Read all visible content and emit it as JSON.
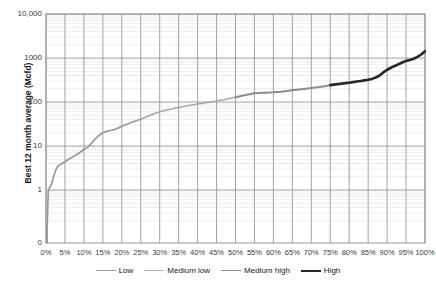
{
  "chart_data": {
    "type": "line",
    "title": "",
    "xlabel": "",
    "ylabel": "Best 12 month average (Mcfd)",
    "yscale": "log",
    "ylim": [
      0.1,
      10000
    ],
    "xlim": [
      0,
      100
    ],
    "grid": true,
    "legend_position": "bottom",
    "y_tick_labels": [
      "10,000",
      "1000",
      "100",
      "10",
      "1",
      "0"
    ],
    "y_tick_values": [
      10000,
      1000,
      100,
      10,
      1,
      0.1
    ],
    "x_tick_labels": [
      "0%",
      "5%",
      "10%",
      "15%",
      "20%",
      "25%",
      "30%",
      "35%",
      "40%",
      "45%",
      "50%",
      "55%",
      "60%",
      "65%",
      "70%",
      "75%",
      "80%",
      "85%",
      "90%",
      "95%",
      "100%"
    ],
    "x_tick_values": [
      0,
      5,
      10,
      15,
      20,
      25,
      30,
      35,
      40,
      45,
      50,
      55,
      60,
      65,
      70,
      75,
      80,
      85,
      90,
      95,
      100
    ],
    "series": [
      {
        "name": "Low",
        "color": "#9a9a9a",
        "x": [
          0.3,
          0.6,
          0.9,
          1.2,
          1.6,
          2.0,
          2.6,
          3.2,
          4.0,
          5.0,
          6.0,
          7.0,
          8.0,
          9.0,
          10.0,
          11.0,
          12.0,
          13.0,
          14.0,
          15.0,
          16.0,
          17.0,
          18.0,
          19.0,
          20.0,
          21.0,
          22.0,
          23.0,
          24.0,
          25.0
        ],
        "y": [
          0.14,
          0.9,
          1.15,
          1.2,
          1.5,
          2.0,
          2.9,
          3.5,
          3.9,
          4.4,
          5.0,
          5.6,
          6.3,
          7.2,
          8.3,
          9.4,
          11.5,
          14.5,
          17.5,
          20.0,
          21.5,
          22.5,
          23.5,
          25.5,
          28.0,
          30.5,
          33.0,
          35.5,
          38.0,
          40.5
        ]
      },
      {
        "name": "Medium low",
        "color": "#a6a6a6",
        "x": [
          25.0,
          26.0,
          27.0,
          28.0,
          29.0,
          30.0,
          31.0,
          32.0,
          33.0,
          34.0,
          35.0,
          36.0,
          37.0,
          38.0,
          39.0,
          40.0,
          41.0,
          42.0,
          43.0,
          44.0,
          45.0,
          46.0,
          47.0,
          48.0,
          49.0,
          50.0
        ],
        "y": [
          40.5,
          44.0,
          48.0,
          52.0,
          56.0,
          60.0,
          63.0,
          66.0,
          69.0,
          72.0,
          75.0,
          78.0,
          81.0,
          84.0,
          87.0,
          90.0,
          93.0,
          96.0,
          99.0,
          102.0,
          105.0,
          109.0,
          113.0,
          118.0,
          123.0,
          128.0
        ]
      },
      {
        "name": "Medium high",
        "color": "#8c8c8c",
        "x": [
          50.0,
          52.0,
          54.0,
          55.0,
          56.0,
          58.0,
          60.0,
          62.0,
          64.0,
          65.0,
          66.0,
          68.0,
          70.0,
          72.0,
          74.0,
          75.0
        ],
        "y": [
          128.0,
          140.0,
          152.0,
          158.0,
          160.0,
          163.0,
          166.0,
          172.0,
          180.0,
          185.0,
          190.0,
          198.0,
          207.0,
          218.0,
          232.0,
          242.0
        ]
      },
      {
        "name": "High",
        "color": "#262626",
        "x": [
          75.0,
          76.0,
          77.0,
          78.0,
          79.0,
          80.0,
          81.0,
          82.0,
          83.0,
          84.0,
          85.0,
          86.0,
          87.0,
          88.0,
          89.0,
          90.0,
          91.0,
          92.0,
          93.0,
          94.0,
          95.0,
          96.0,
          97.0,
          98.0,
          99.0,
          100.0
        ],
        "y": [
          242.0,
          248.0,
          255.0,
          262.0,
          268.0,
          275.0,
          283.0,
          292.0,
          300.0,
          310.0,
          320.0,
          335.0,
          360.0,
          400.0,
          470.0,
          540.0,
          600.0,
          660.0,
          720.0,
          790.0,
          860.0,
          900.0,
          960.0,
          1060.0,
          1200.0,
          1420.0
        ]
      }
    ]
  },
  "legend": {
    "items": [
      {
        "label": "Low",
        "color": "#9a9a9a",
        "thickness": 1.6
      },
      {
        "label": "Medium low",
        "color": "#b5b5b5",
        "thickness": 1.3
      },
      {
        "label": "Medium high",
        "color": "#8c8c8c",
        "thickness": 1.8
      },
      {
        "label": "High",
        "color": "#262626",
        "thickness": 2.4
      }
    ]
  },
  "axes": {
    "y_title": "Best 12 month average (Mcfd)"
  },
  "colors": {
    "grid_major": "#8c8c8c",
    "grid_minor": "#d9d9d9",
    "axis": "#808080",
    "text": "#3a3a3a"
  }
}
